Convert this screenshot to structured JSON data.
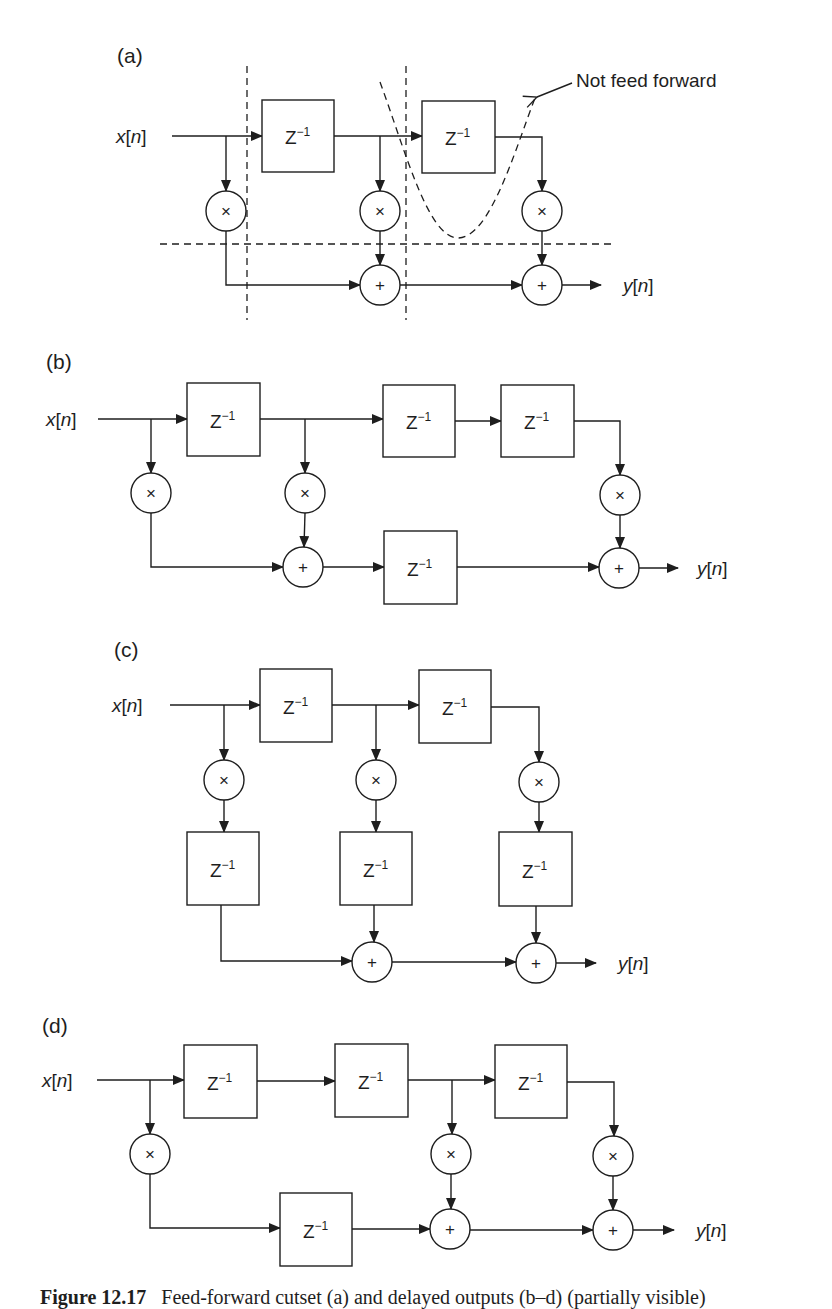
{
  "figure": {
    "caption_number": "Figure 12.17",
    "caption_text": "Feed-forward cutset (a) and delayed outputs (b–d) (partially visible)"
  },
  "symbols": {
    "delay": "Z",
    "delay_exp": "−1",
    "multiply": "×",
    "add": "+",
    "input": "x",
    "output": "y",
    "index": "n"
  },
  "colors": {
    "ink": "#1e1e1e",
    "background": "#ffffff"
  },
  "panels": [
    {
      "id": "a",
      "label": "(a)",
      "annotation": "Not feed forward",
      "delays_top": 2,
      "multipliers": 3,
      "adders": 2,
      "cutsets": [
        "vertical-1",
        "vertical-2",
        "horizontal"
      ]
    },
    {
      "id": "b",
      "label": "(b)",
      "delays_top": 3,
      "delays_bottom": 1,
      "multipliers": 3,
      "adders": 2
    },
    {
      "id": "c",
      "label": "(c)",
      "delays_top": 2,
      "delays_middle": 3,
      "multipliers": 3,
      "adders": 2
    },
    {
      "id": "d",
      "label": "(d)",
      "delays_top": 3,
      "delays_bottom": 1,
      "multipliers": 3,
      "adders": 2
    }
  ]
}
